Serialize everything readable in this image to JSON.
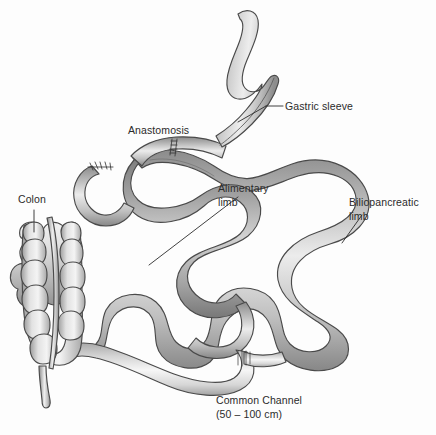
{
  "figure": {
    "background_color": "#fdfdfd",
    "line_color": "#4a4a4a",
    "text_color": "#2b2b2b"
  },
  "labels": {
    "gastric_sleeve": "Gastric sleeve",
    "anastomosis": "Anastomosis",
    "alimentary_limb_line1": "Alimentary",
    "alimentary_limb_line2": "limb",
    "biliopancreatic_limb_line1": "Biliopancreatic",
    "biliopancreatic_limb_line2": "limb",
    "colon": "Colon",
    "common_channel_line1": "Common Channel",
    "common_channel_line2": "(50 – 100 cm)"
  },
  "structures": [
    {
      "name": "gastric-sleeve",
      "label": "Gastric sleeve",
      "shading": "gray-gradient",
      "feature": "staple-line"
    },
    {
      "name": "anastomosis",
      "label": "Anastomosis",
      "feature": "suture-marks"
    },
    {
      "name": "duodenal-stump",
      "label": "",
      "feature": "staple-line"
    },
    {
      "name": "alimentary-limb",
      "label": "Alimentary limb",
      "shading": "dark-gray"
    },
    {
      "name": "biliopancreatic-limb",
      "label": "Biliopancreatic limb",
      "shading": "mid-gray"
    },
    {
      "name": "common-channel",
      "label": "Common Channel (50 – 100 cm)",
      "shading": "light-gray"
    },
    {
      "name": "colon",
      "label": "Colon",
      "feature": "haustra"
    }
  ]
}
